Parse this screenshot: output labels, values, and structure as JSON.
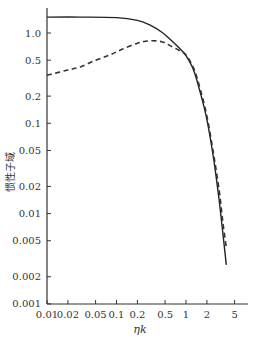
{
  "chart_data": {
    "type": "line",
    "title": "",
    "xlabel": "ηk",
    "ylabel": "惯性子域",
    "xscale": "log",
    "yscale": "log",
    "xlim": [
      0.01,
      8
    ],
    "ylim": [
      0.001,
      2
    ],
    "grid": false,
    "legend": null,
    "x_ticks": [
      0.01,
      0.02,
      0.05,
      0.1,
      0.2,
      0.5,
      1,
      2,
      5
    ],
    "x_tick_labels": [
      "0.01",
      "0.02",
      "0.05",
      "0.1",
      "0.2",
      "0.5",
      "1",
      "2",
      "5"
    ],
    "y_ticks": [
      0.001,
      0.002,
      0.005,
      0.01,
      0.02,
      0.05,
      0.1,
      0.2,
      0.5,
      1.0
    ],
    "y_tick_labels": [
      "0.001",
      "0.002",
      "0.005",
      "0.01",
      "0.02",
      "0.05",
      "0.1",
      "0.2",
      "0.5",
      "1.0"
    ],
    "series": [
      {
        "name": "solid",
        "style": "solid",
        "color": "#222222",
        "x": [
          0.01,
          0.03,
          0.1,
          0.2,
          0.3,
          0.45,
          0.6,
          0.8,
          1.0,
          1.3,
          1.6,
          2.0,
          2.5,
          3.0,
          3.4,
          3.8
        ],
        "y": [
          1.5,
          1.5,
          1.48,
          1.38,
          1.23,
          1.02,
          0.84,
          0.68,
          0.56,
          0.38,
          0.22,
          0.11,
          0.04,
          0.014,
          0.006,
          0.0027
        ]
      },
      {
        "name": "dashed",
        "style": "dashed",
        "color": "#333333",
        "x": [
          0.01,
          0.02,
          0.03,
          0.05,
          0.08,
          0.12,
          0.2,
          0.3,
          0.45,
          0.6,
          0.8,
          1.0,
          1.3,
          1.6,
          2.0,
          2.5,
          3.0,
          3.4,
          3.8
        ],
        "y": [
          0.34,
          0.39,
          0.42,
          0.5,
          0.57,
          0.66,
          0.77,
          0.82,
          0.8,
          0.72,
          0.64,
          0.57,
          0.4,
          0.24,
          0.12,
          0.045,
          0.018,
          0.008,
          0.0042
        ]
      }
    ]
  }
}
